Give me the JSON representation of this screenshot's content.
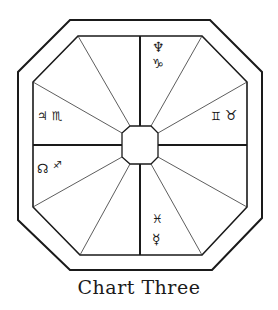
{
  "diagram": {
    "title": "Chart Three",
    "colors": {
      "stroke": "#1a1a1a",
      "background": "#ffffff"
    },
    "houses": {
      "top": {
        "symbols": [
          "♆",
          "♑"
        ],
        "names": [
          "Neptune",
          "Capricorn"
        ]
      },
      "left": {
        "symbols": [
          "♃",
          "♏"
        ],
        "names": [
          "Jupiter",
          "Scorpio"
        ]
      },
      "right": {
        "symbols": [
          "♊",
          "♉"
        ],
        "names": [
          "Gemini",
          "Taurus"
        ]
      },
      "lower_left": {
        "symbols": [
          "☊",
          "♐"
        ],
        "names": [
          "North Node",
          "Sagittarius"
        ]
      },
      "bottom": {
        "symbols": [
          "♓",
          "☿"
        ],
        "names": [
          "Pisces",
          "Mercury"
        ]
      }
    }
  }
}
